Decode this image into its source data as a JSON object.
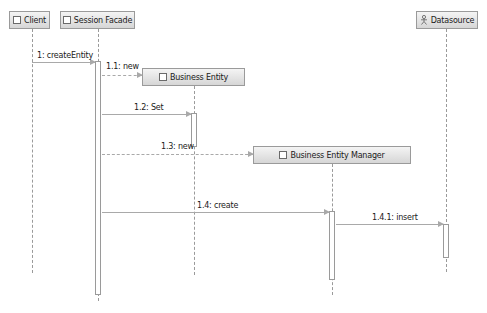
{
  "diagram": {
    "type": "UML sequence diagram",
    "lifelines": [
      {
        "id": "client",
        "label": "Client",
        "icon": "class-icon"
      },
      {
        "id": "session_facade",
        "label": "Session Facade",
        "icon": "class-icon"
      },
      {
        "id": "business_entity",
        "label": "Business Entity",
        "icon": "class-icon"
      },
      {
        "id": "business_entity_manager",
        "label": "Business Entity Manager",
        "icon": "class-icon"
      },
      {
        "id": "datasource",
        "label": "Datasource",
        "icon": "actor-icon"
      }
    ],
    "messages": [
      {
        "label": "1: createEntity",
        "from": "Client",
        "to": "Session Facade",
        "style": "solid"
      },
      {
        "label": "1.1: new",
        "from": "Session Facade",
        "to": "Business Entity",
        "style": "dashed"
      },
      {
        "label": "1.2: Set",
        "from": "Session Facade",
        "to": "Business Entity",
        "style": "solid"
      },
      {
        "label": "1.3: new",
        "from": "Session Facade",
        "to": "Business Entity Manager",
        "style": "dashed"
      },
      {
        "label": "1.4: create",
        "from": "Session Facade",
        "to": "Business Entity Manager",
        "style": "solid"
      },
      {
        "label": "1.4.1: insert",
        "from": "Business Entity Manager",
        "to": "Datasource",
        "style": "solid"
      }
    ]
  }
}
